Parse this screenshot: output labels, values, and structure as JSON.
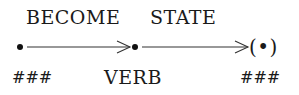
{
  "diagram": {
    "top_labels": [
      "BECOME",
      "STATE"
    ],
    "bottom_labels": [
      "###",
      "VERB",
      "###"
    ],
    "nodes": [
      {
        "id": "start",
        "symbol": "•"
      },
      {
        "id": "middle",
        "symbol": "•"
      },
      {
        "id": "end",
        "symbol": "(•)"
      }
    ],
    "edges": [
      {
        "from": "start",
        "to": "middle",
        "label": "BECOME"
      },
      {
        "from": "middle",
        "to": "end",
        "label": "STATE"
      }
    ],
    "end_node_text": "(•)"
  }
}
